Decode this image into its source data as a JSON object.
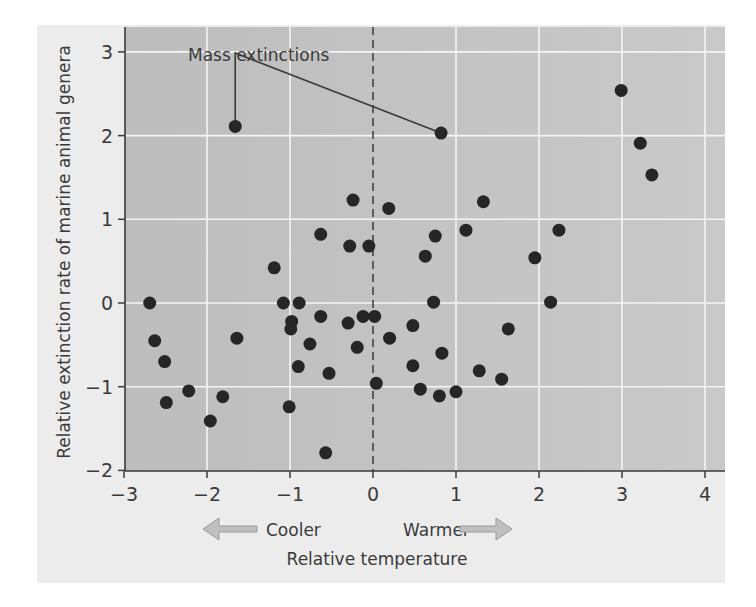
{
  "chart_data": {
    "type": "scatter",
    "title": "",
    "xlabel": "Relative temperature",
    "ylabel": "Relative extinction rate of marine animal genera",
    "xlim": [
      -3,
      4.25
    ],
    "ylim": [
      -2,
      3.3
    ],
    "x_ticks": [
      -3,
      -2,
      -1,
      0,
      1,
      2,
      3,
      4
    ],
    "x_tick_labels": [
      "−3",
      "−2",
      "−1",
      "0",
      "1",
      "2",
      "3",
      "4"
    ],
    "y_ticks": [
      -2,
      -1,
      0,
      1,
      2,
      3
    ],
    "y_tick_labels": [
      "−2",
      "−1",
      "0",
      "1",
      "2",
      "3"
    ],
    "grid": true,
    "reference_line": {
      "x": 0,
      "style": "dashed"
    },
    "direction_labels": {
      "left": "Cooler",
      "right": "Warmer"
    },
    "annotation": {
      "text": "Mass extinctions",
      "points": [
        [
          -1.66,
          2.11
        ],
        [
          0.82,
          2.03
        ]
      ]
    },
    "colors": {
      "point": "#262626",
      "plot_bg_left": "#bdbdbd",
      "plot_bg_right": "#c9c9c9",
      "panel_bg": "#ececec",
      "grid": "#f4f4f4",
      "arrow": "#bfbfbf"
    },
    "points": [
      {
        "x": -2.69,
        "y": 0.0
      },
      {
        "x": -2.63,
        "y": -0.45
      },
      {
        "x": -2.51,
        "y": -0.7
      },
      {
        "x": -2.49,
        "y": -1.19
      },
      {
        "x": -2.22,
        "y": -1.05
      },
      {
        "x": -1.96,
        "y": -1.41
      },
      {
        "x": -1.81,
        "y": -1.12
      },
      {
        "x": -1.66,
        "y": 2.11
      },
      {
        "x": -1.64,
        "y": -0.42
      },
      {
        "x": -1.19,
        "y": 0.42
      },
      {
        "x": -1.08,
        "y": 0.0
      },
      {
        "x": -1.01,
        "y": -1.24
      },
      {
        "x": -0.99,
        "y": -0.31
      },
      {
        "x": -0.98,
        "y": -0.22
      },
      {
        "x": -0.9,
        "y": -0.76
      },
      {
        "x": -0.89,
        "y": 0.0
      },
      {
        "x": -0.76,
        "y": -0.49
      },
      {
        "x": -0.63,
        "y": 0.82
      },
      {
        "x": -0.63,
        "y": -0.16
      },
      {
        "x": -0.57,
        "y": -1.79
      },
      {
        "x": -0.53,
        "y": -0.84
      },
      {
        "x": -0.3,
        "y": -0.24
      },
      {
        "x": -0.28,
        "y": 0.68
      },
      {
        "x": -0.24,
        "y": 1.23
      },
      {
        "x": -0.19,
        "y": -0.53
      },
      {
        "x": -0.12,
        "y": -0.16
      },
      {
        "x": -0.05,
        "y": 0.68
      },
      {
        "x": 0.02,
        "y": -0.16
      },
      {
        "x": 0.04,
        "y": -0.96
      },
      {
        "x": 0.19,
        "y": 1.13
      },
      {
        "x": 0.2,
        "y": -0.42
      },
      {
        "x": 0.48,
        "y": -0.27
      },
      {
        "x": 0.48,
        "y": -0.75
      },
      {
        "x": 0.57,
        "y": -1.03
      },
      {
        "x": 0.63,
        "y": 0.56
      },
      {
        "x": 0.73,
        "y": 0.01
      },
      {
        "x": 0.75,
        "y": 0.8
      },
      {
        "x": 0.8,
        "y": -1.11
      },
      {
        "x": 0.82,
        "y": 2.03
      },
      {
        "x": 0.83,
        "y": -0.6
      },
      {
        "x": 1.0,
        "y": -1.06
      },
      {
        "x": 1.12,
        "y": 0.87
      },
      {
        "x": 1.28,
        "y": -0.81
      },
      {
        "x": 1.33,
        "y": 1.21
      },
      {
        "x": 1.55,
        "y": -0.91
      },
      {
        "x": 1.63,
        "y": -0.31
      },
      {
        "x": 1.95,
        "y": 0.54
      },
      {
        "x": 2.14,
        "y": 0.01
      },
      {
        "x": 2.24,
        "y": 0.87
      },
      {
        "x": 2.99,
        "y": 2.54
      },
      {
        "x": 3.22,
        "y": 1.91
      },
      {
        "x": 3.36,
        "y": 1.53
      }
    ]
  }
}
